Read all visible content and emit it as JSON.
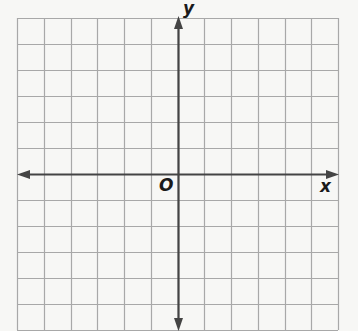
{
  "diagram": {
    "type": "coordinate-plane",
    "labels": {
      "x_axis": "x",
      "y_axis": "y",
      "origin": "O"
    },
    "grid": {
      "columns": 12,
      "rows": 12,
      "left": 17,
      "top": 18,
      "cell_width": 26.75,
      "cell_height": 26,
      "y_axis_column": 6,
      "x_axis_row": 6
    },
    "colors": {
      "background": "#f7f7f5",
      "grid_line": "#a8a8a8",
      "axis": "#444444",
      "label": "#1a1a1a"
    }
  }
}
